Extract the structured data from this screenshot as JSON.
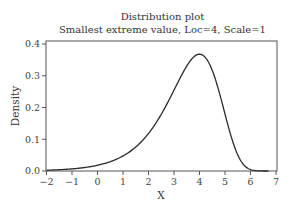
{
  "chart_data": {
    "type": "line",
    "title": "Distribution plot",
    "subtitle": "Smallest extreme value, Loc=4, Scale=1",
    "xlabel": "X",
    "ylabel": "Density",
    "xlim": [
      -2.1,
      7.1
    ],
    "ylim": [
      0.0,
      0.41
    ],
    "x_ticks": [
      -2,
      -1,
      0,
      1,
      2,
      3,
      4,
      5,
      6,
      7
    ],
    "y_ticks": [
      0.0,
      0.1,
      0.2,
      0.3,
      0.4
    ],
    "x_tick_labels": [
      "−2",
      "−1",
      "0",
      "1",
      "2",
      "3",
      "4",
      "5",
      "6",
      "7"
    ],
    "y_tick_labels": [
      "0.0",
      "0.1",
      "0.2",
      "0.3",
      "0.4"
    ],
    "grid": false,
    "legend": null,
    "distribution": {
      "name": "Smallest extreme value",
      "loc": 4,
      "scale": 1
    },
    "series": [
      {
        "name": "Density",
        "x": [
          -2.0,
          -1.5,
          -1.0,
          -0.5,
          0.0,
          0.5,
          1.0,
          1.5,
          2.0,
          2.5,
          3.0,
          3.5,
          4.0,
          4.5,
          5.0,
          5.5,
          6.0,
          6.5,
          6.7
        ],
        "values": [
          0.0025,
          0.0041,
          0.0067,
          0.011,
          0.018,
          0.029,
          0.047,
          0.074,
          0.118,
          0.179,
          0.254,
          0.33,
          0.368,
          0.318,
          0.179,
          0.051,
          0.004,
          0.0,
          0.0
        ]
      }
    ]
  }
}
